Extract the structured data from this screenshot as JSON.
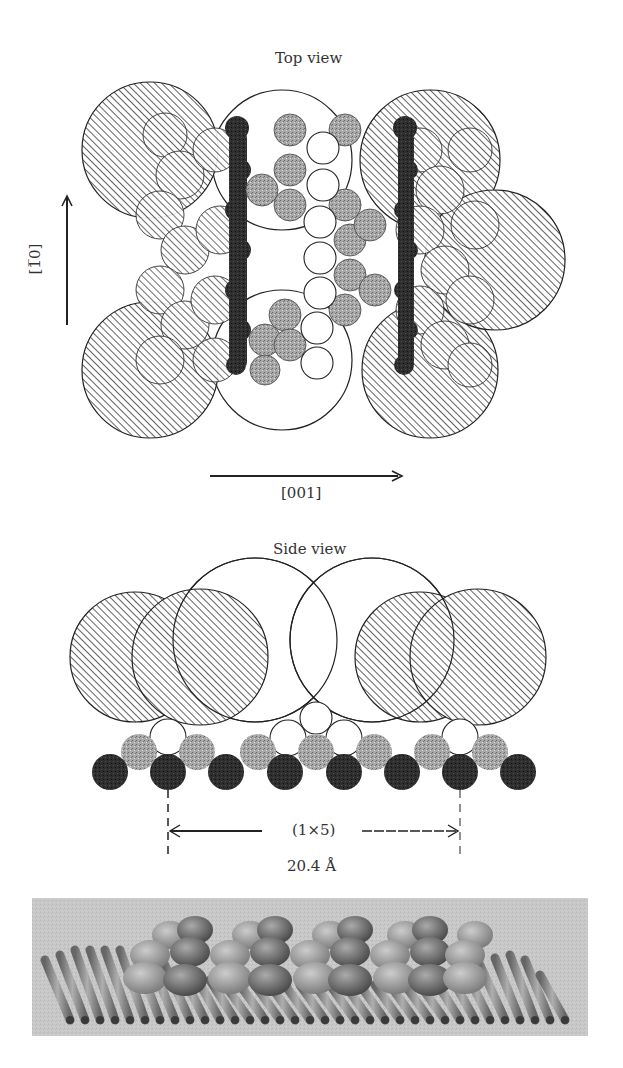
{
  "figure": {
    "top_view": {
      "title": "Top view",
      "axis_vertical_label": "[1̅0]",
      "axis_horizontal_label": "[001]"
    },
    "side_view": {
      "title": "Side view",
      "periodicity_label": "(1×5)",
      "distance_label": "20.4 Å"
    },
    "rendering_3d": {
      "description": "3D perspective rendering of reconstructed surface with rows of atoms on a corrugated substrate"
    }
  },
  "colors": {
    "background": "#ffffff",
    "outline": "#222222",
    "hatch": "#333333",
    "dark_atom": "#2a2a2a",
    "gray_atom": "#9a9a9a",
    "light_atom": "#ffffff",
    "render_bg": "#d4d4d4"
  }
}
